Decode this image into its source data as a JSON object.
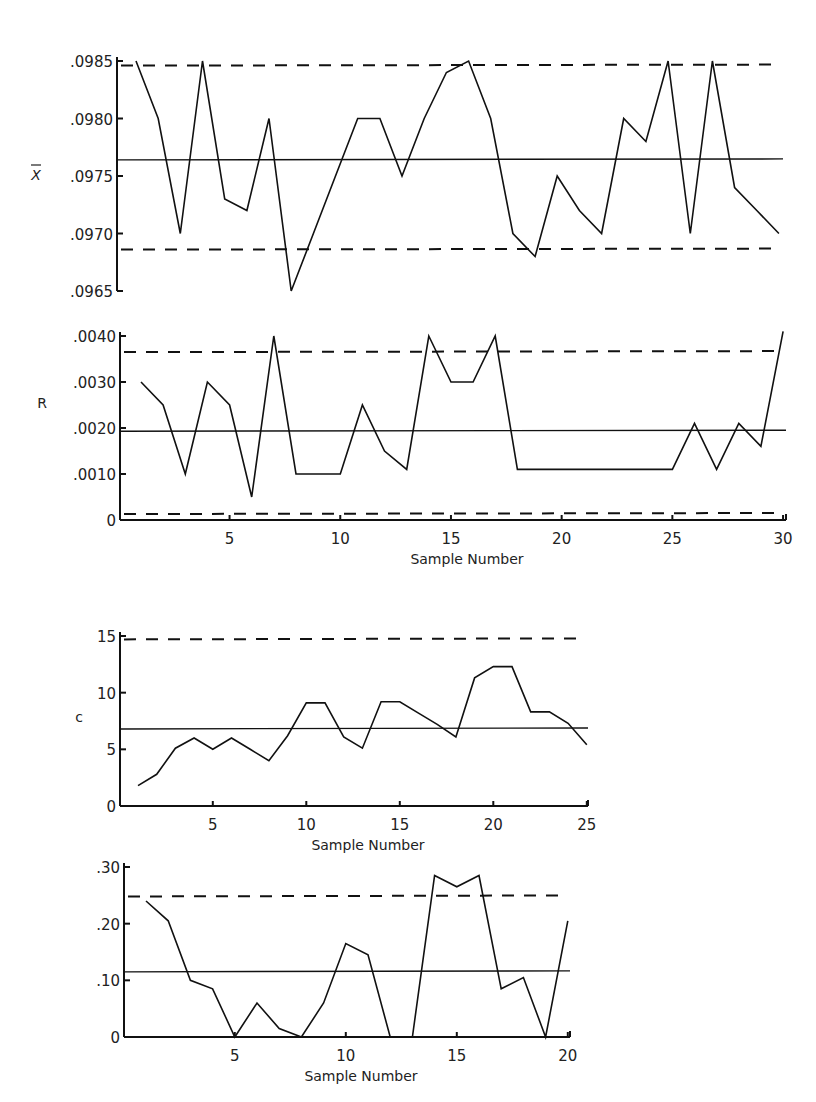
{
  "chart_data": [
    {
      "id": "xbar",
      "type": "line",
      "title": "",
      "ylabel": "X̄",
      "xlabel": "",
      "x": [
        1,
        2,
        3,
        4,
        5,
        6,
        7,
        8,
        9,
        10,
        11,
        12,
        13,
        14,
        15,
        16,
        17,
        18,
        19,
        20,
        21,
        22,
        23,
        24,
        25,
        26,
        27,
        28,
        29,
        30
      ],
      "series": [
        {
          "name": "X-bar",
          "values": [
            0.0985,
            0.098,
            0.097,
            0.0985,
            0.0973,
            0.0972,
            0.098,
            0.0965,
            0.097,
            0.0975,
            0.098,
            0.098,
            0.0975,
            0.098,
            0.0984,
            0.0985,
            0.098,
            0.097,
            0.0968,
            0.0975,
            0.0972,
            0.097,
            0.098,
            0.0978,
            0.0985,
            0.097,
            0.0985,
            0.0974,
            0.0972,
            0.097
          ]
        }
      ],
      "control_lines": {
        "center": 0.09764,
        "ucl": 0.09846,
        "lcl": 0.09686
      },
      "ylim": [
        0.0965,
        0.0985
      ],
      "yticks": [
        ".0985",
        ".0980",
        ".0975",
        ".0970",
        ".0965"
      ],
      "ytick_values": [
        0.0985,
        0.098,
        0.0975,
        0.097,
        0.0965
      ],
      "xticks": [],
      "grid": false,
      "layout": {
        "x0": 117,
        "y_top": 61,
        "y_bottom": 291,
        "x_first": 136,
        "px_per_x": 22.17,
        "x_end": 783
      }
    },
    {
      "id": "range",
      "type": "line",
      "title": "",
      "ylabel": "R",
      "xlabel": "Sample Number",
      "x": [
        1,
        2,
        3,
        4,
        5,
        6,
        7,
        8,
        9,
        10,
        11,
        12,
        13,
        14,
        15,
        16,
        17,
        18,
        19,
        20,
        21,
        22,
        23,
        24,
        25,
        26,
        27,
        28,
        29,
        30
      ],
      "series": [
        {
          "name": "Range",
          "values": [
            0.003,
            0.0025,
            0.001,
            0.003,
            0.0025,
            0.0005,
            0.004,
            0.001,
            0.001,
            0.001,
            0.0025,
            0.0015,
            0.0011,
            0.004,
            0.003,
            0.003,
            0.004,
            0.0011,
            0.0011,
            0.0011,
            0.0011,
            0.0011,
            0.0011,
            0.0011,
            0.0011,
            0.0021,
            0.0011,
            0.0021,
            0.0016,
            0.0041
          ]
        }
      ],
      "control_lines": {
        "center": 0.00193,
        "ucl": 0.00365,
        "lcl": 0.00013
      },
      "ylim": [
        0,
        0.004
      ],
      "yticks": [
        ".0040",
        ".0030",
        ".0020",
        ".0010",
        "0"
      ],
      "ytick_values": [
        0.004,
        0.003,
        0.002,
        0.001,
        0
      ],
      "xticks": [
        "5",
        "10",
        "15",
        "20",
        "25",
        "30"
      ],
      "xtick_values": [
        5,
        10,
        15,
        20,
        25,
        30
      ],
      "grid": false,
      "layout": {
        "x0": 120,
        "y_top": 336,
        "y_bottom": 520,
        "x_first": 141,
        "px_per_x": 22.14,
        "x_end": 786
      }
    },
    {
      "id": "c",
      "type": "line",
      "title": "",
      "ylabel": "c",
      "xlabel": "Sample Number",
      "x": [
        1,
        2,
        3,
        4,
        5,
        6,
        7,
        8,
        9,
        10,
        11,
        12,
        13,
        14,
        15,
        16,
        17,
        18,
        19,
        20,
        21,
        22,
        23,
        24,
        25
      ],
      "series": [
        {
          "name": "c",
          "values": [
            1.8,
            2.8,
            5.1,
            6.0,
            5.0,
            6.0,
            5.0,
            4.0,
            6.2,
            9.1,
            9.1,
            6.1,
            5.1,
            9.2,
            9.2,
            8.2,
            7.2,
            6.1,
            11.3,
            12.3,
            12.3,
            8.3,
            8.3,
            7.3,
            5.4
          ]
        }
      ],
      "control_lines": {
        "center": 6.8,
        "ucl": 14.7,
        "lcl": null
      },
      "ylim": [
        0,
        15
      ],
      "yticks": [
        "15",
        "10",
        "5",
        "0"
      ],
      "ytick_values": [
        15,
        10,
        5,
        0
      ],
      "xticks": [
        "5",
        "10",
        "15",
        "20",
        "25"
      ],
      "xtick_values": [
        5,
        10,
        15,
        20,
        25
      ],
      "grid": false,
      "layout": {
        "x0": 120,
        "y_top": 636,
        "y_bottom": 806,
        "x_first": 138,
        "px_per_x": 18.7,
        "x_end": 588
      }
    },
    {
      "id": "p",
      "type": "line",
      "title": "",
      "ylabel": "",
      "xlabel": "Sample Number",
      "x": [
        1,
        2,
        3,
        4,
        5,
        6,
        7,
        8,
        9,
        10,
        11,
        12,
        13,
        14,
        15,
        16,
        17,
        18,
        19,
        20
      ],
      "series": [
        {
          "name": "p",
          "values": [
            0.24,
            0.205,
            0.1,
            0.085,
            0.0,
            0.06,
            0.015,
            0.0,
            0.06,
            0.165,
            0.145,
            0.0,
            0.0,
            0.285,
            0.265,
            0.285,
            0.085,
            0.105,
            0.0,
            0.205
          ]
        }
      ],
      "control_lines": {
        "center": 0.115,
        "ucl": 0.248,
        "lcl": null
      },
      "ylim": [
        0,
        0.3
      ],
      "yticks": [
        ".30",
        ".20",
        ".10",
        "0"
      ],
      "ytick_values": [
        0.3,
        0.2,
        0.1,
        0
      ],
      "xticks": [
        "5",
        "10",
        "15",
        "20"
      ],
      "xtick_values": [
        5,
        10,
        15,
        20
      ],
      "grid": false,
      "layout": {
        "x0": 124,
        "y_top": 867,
        "y_bottom": 1037,
        "x_first": 146,
        "px_per_x": 22.2,
        "x_end": 570
      }
    }
  ]
}
